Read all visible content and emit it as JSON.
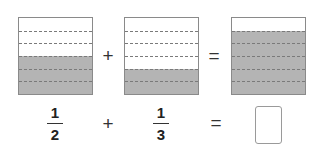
{
  "models": [
    {
      "id": "half",
      "left": 18,
      "divisions": 6,
      "shaded": 3
    },
    {
      "id": "third",
      "left": 124,
      "divisions": 6,
      "shaded": 2
    },
    {
      "id": "sum",
      "left": 231,
      "divisions": 6,
      "shaded": 5
    }
  ],
  "colors": {
    "shade": "#b4b4b4",
    "border": "#8a8a8a",
    "divider": "#7a7a7a"
  },
  "top_row": {
    "plus": "+",
    "equals": "="
  },
  "bottom_row": {
    "fraction1": {
      "numerator": "1",
      "denominator": "2"
    },
    "plus": "+",
    "fraction2": {
      "numerator": "1",
      "denominator": "3"
    },
    "equals": "=",
    "answer": ""
  }
}
